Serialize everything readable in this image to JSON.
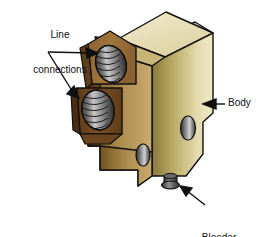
{
  "figure": {
    "type": "technical-illustration",
    "background_color": "#ffffff",
    "line_color": "#101010"
  },
  "labels": {
    "line_connections": "Line\nconnections",
    "line_connections_line1": "Line",
    "line_connections_line2": "connections",
    "body": "Body",
    "bleeder_stem_line1": "Bleeder",
    "bleeder_stem_line2": "stem"
  },
  "colors": {
    "top_face_light": "#efe8c4",
    "top_face_shadow": "#d9cfa0",
    "front_face_dark": "#7d5e2a",
    "front_face_light": "#c3a063",
    "right_face_dark": "#8b7a3c",
    "right_face_light": "#efe8c4",
    "boss_upper": "#9a6f39",
    "boss_lower_dark": "#6b4520",
    "port_dark": "#2e2e2e",
    "port_light": "#b9b9b9",
    "outline": "#101010",
    "stem_dark": "#3a3a3a"
  },
  "parts": [
    {
      "name": "top-face",
      "label": "top chamfer face"
    },
    {
      "name": "right-face",
      "label": "body right side"
    },
    {
      "name": "front-face",
      "label": "body front"
    },
    {
      "name": "upper-port",
      "label": "upper line connection port"
    },
    {
      "name": "lower-port",
      "label": "lower line connection port"
    },
    {
      "name": "right-hole",
      "label": "right side hole"
    },
    {
      "name": "bottom-hole",
      "label": "bottom front hole"
    },
    {
      "name": "bleeder-stem",
      "label": "bleeder stem"
    }
  ]
}
